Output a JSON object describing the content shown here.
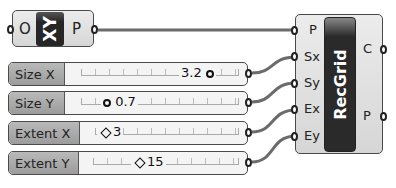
{
  "xy_component": {
    "icon_label": "XY",
    "input": "O",
    "output": "P"
  },
  "sliders": [
    {
      "name": "Size X",
      "value": "3.2",
      "grip": "circle"
    },
    {
      "name": "Size Y",
      "value": "0.7",
      "grip": "circle"
    },
    {
      "name": "Extent X",
      "value": "3",
      "grip": "diamond"
    },
    {
      "name": "Extent Y",
      "value": "15",
      "grip": "diamond"
    }
  ],
  "recgrid": {
    "icon_label": "RecGrid",
    "inputs": [
      "P",
      "Sx",
      "Sy",
      "Ex",
      "Ey"
    ],
    "outputs": [
      "C",
      "P"
    ]
  },
  "colors": {
    "wire": "#6b6b6b",
    "component_border": "#4a4a4a",
    "icon_bg": "#262626"
  }
}
